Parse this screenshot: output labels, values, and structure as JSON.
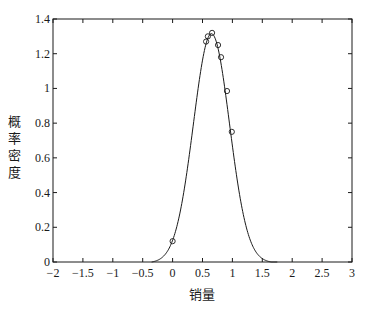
{
  "chart_data": {
    "type": "line",
    "title": "",
    "xlabel": "销量",
    "ylabel": "概率密度",
    "xlim": [
      -2,
      3
    ],
    "ylim": [
      0,
      1.4
    ],
    "xticks": [
      -2,
      -1.5,
      -1,
      -0.5,
      0,
      0.5,
      1,
      1.5,
      2,
      2.5,
      3
    ],
    "xtick_labels": [
      "-2",
      "-1.5",
      "-1",
      "-0.5",
      "0",
      "0.5",
      "1",
      "1.5",
      "2",
      "2.5",
      "3"
    ],
    "yticks": [
      0,
      0.2,
      0.4,
      0.6,
      0.8,
      1,
      1.2,
      1.4
    ],
    "ytick_labels": [
      "0",
      "0.2",
      "0.4",
      "0.6",
      "0.8",
      "1",
      "1.2",
      "1.4"
    ],
    "grid": false,
    "box": true,
    "series": [
      {
        "name": "fitted-density-curve",
        "kind": "line",
        "distribution": "normal",
        "mean": 0.65,
        "sd": 0.302,
        "x_range": [
          -0.35,
          1.75
        ],
        "color": "#1a1a1a"
      },
      {
        "name": "sample-points",
        "kind": "scatter",
        "marker": "circle-open",
        "color": "#1a1a1a",
        "x": [
          0.0,
          0.56,
          0.59,
          0.66,
          0.76,
          0.81,
          0.91,
          0.99
        ],
        "y": [
          0.12,
          1.27,
          1.3,
          1.32,
          1.25,
          1.18,
          0.985,
          0.75
        ]
      }
    ]
  }
}
